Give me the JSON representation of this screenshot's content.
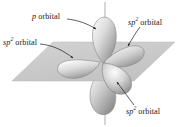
{
  "figure": {
    "background_color": "#ffffff",
    "plane_color": "#c9c9c9",
    "axis_color": "#9a9a9a",
    "leader_color": "#2b2b2b",
    "lobe_light": "#f2f2f2",
    "lobe_mid": "#bdbdbd",
    "lobe_dark": "#8a8a8a"
  },
  "labels": {
    "p_orbital": {
      "symbol": "p",
      "superscript": "",
      "word": "orbital"
    },
    "sp2_left": {
      "symbol": "sp",
      "superscript": "2",
      "word": "orbital"
    },
    "sp2_topright": {
      "symbol": "sp",
      "superscript": "2",
      "word": "orbital"
    },
    "sp2_bottom": {
      "symbol": "sp",
      "superscript": "2",
      "word": "orbital"
    }
  },
  "orbitals": [
    {
      "name": "p-orbital-upper-lobe",
      "type": "p",
      "direction": "up"
    },
    {
      "name": "p-orbital-lower-lobe",
      "type": "p",
      "direction": "down"
    },
    {
      "name": "sp2-orbital-left",
      "type": "sp2",
      "direction": "left"
    },
    {
      "name": "sp2-orbital-upper-right",
      "type": "sp2",
      "direction": "upper-right"
    },
    {
      "name": "sp2-orbital-lower-right",
      "type": "sp2",
      "direction": "lower-right"
    }
  ]
}
